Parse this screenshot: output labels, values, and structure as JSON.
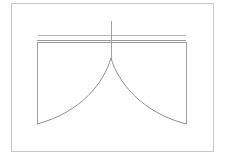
{
  "canvas": {
    "width": 228,
    "height": 164,
    "background_color": "#ffffff"
  },
  "figure": {
    "title": "",
    "caption": "",
    "stroke_color": "#9a9a9a",
    "border_color": "#bdbdbd",
    "line_color": "#a8a8a8",
    "curve_color": "#8f8f8f"
  },
  "elements": {
    "page_border": {
      "name": "page-border",
      "x": 11,
      "y": 3,
      "width": 202,
      "height": 148,
      "stroke_width": 1,
      "color": "#c6c6c6"
    },
    "upper_rule": {
      "name": "upper-horizontal-rule",
      "x1": 38,
      "y1": 35,
      "x2": 186,
      "y2": 35,
      "stroke_width": 1,
      "color": "#b4b4b4"
    },
    "lower_rule": {
      "name": "lower-horizontal-rule",
      "x1": 37,
      "y1": 40,
      "x2": 186,
      "y2": 40,
      "stroke_width": 1,
      "color": "#9c9c9c"
    },
    "rect_top": {
      "name": "rectangle-top-edge",
      "x1": 37,
      "y1": 42,
      "x2": 186,
      "y2": 42,
      "stroke_width": 1,
      "color": "#9c9c9c"
    },
    "rect_left": {
      "name": "rectangle-left-edge",
      "x1": 37,
      "y1": 42,
      "x2": 37,
      "y2": 124,
      "stroke_width": 1,
      "color": "#9c9c9c"
    },
    "rect_right": {
      "name": "rectangle-right-edge",
      "x1": 186,
      "y1": 42,
      "x2": 186,
      "y2": 124,
      "stroke_width": 1,
      "color": "#9c9c9c"
    },
    "vertical_axis": {
      "name": "vertical-axis-line",
      "x1": 111,
      "y1": 21,
      "x2": 111,
      "y2": 58,
      "stroke_width": 1,
      "color": "#a0a0a0"
    },
    "cusp_point": {
      "name": "cusp-apex",
      "x": 111,
      "y": 58
    },
    "left_curve": {
      "name": "left-concave-arc",
      "path": "M 111 58 C 104 82 82 112 37 124",
      "stroke_width": 1,
      "color": "#8f8f8f"
    },
    "right_curve": {
      "name": "right-concave-arc",
      "path": "M 111 58 C 118 82 141 112 186 124",
      "stroke_width": 1,
      "color": "#8f8f8f"
    }
  },
  "labels": {
    "none_visible": ""
  }
}
